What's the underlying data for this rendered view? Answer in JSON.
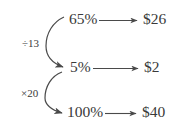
{
  "diagram": {
    "type": "percentage-conversion-flow",
    "background_color": "#ffffff",
    "ink_color": "#3a3a3a",
    "rows": [
      {
        "id": "row-top",
        "percent": "65%",
        "amount": "$26",
        "arrow": "right-arrow"
      },
      {
        "id": "row-middle",
        "percent": "5%",
        "amount": "$2",
        "arrow": "right-arrow"
      },
      {
        "id": "row-bottom",
        "percent": "100%",
        "amount": "$40",
        "arrow": "right-arrow"
      }
    ],
    "operations": [
      {
        "id": "op-divide",
        "label": "÷13",
        "from": "65%",
        "to": "5%",
        "arrow": "curved-down-arrow"
      },
      {
        "id": "op-multiply",
        "label": "×20",
        "from": "5%",
        "to": "100%",
        "arrow": "curved-down-arrow"
      }
    ]
  }
}
